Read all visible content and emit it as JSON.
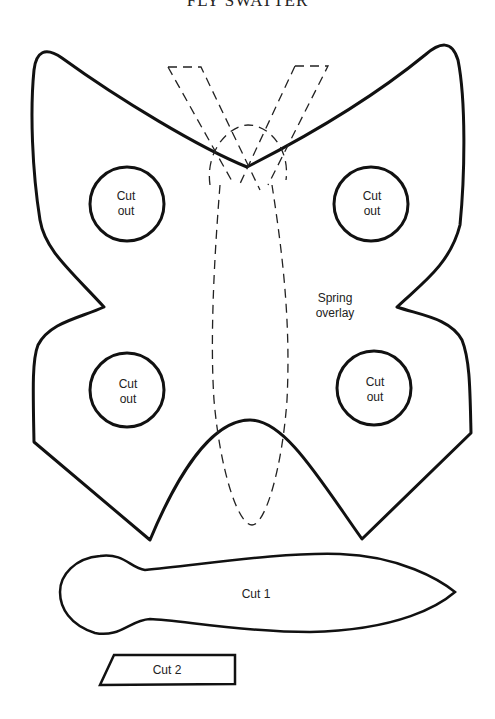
{
  "title": "FLY SWATTER",
  "swatter_body": {
    "cutouts": [
      {
        "position": "top-left",
        "line1": "Cut",
        "line2": "out"
      },
      {
        "position": "top-right",
        "line1": "Cut",
        "line2": "out"
      },
      {
        "position": "bottom-left",
        "line1": "Cut",
        "line2": "out"
      },
      {
        "position": "bottom-right",
        "line1": "Cut",
        "line2": "out"
      }
    ],
    "overlay_label": {
      "line1": "Spring",
      "line2": "overlay"
    }
  },
  "pieces": {
    "handle": {
      "label": "Cut 1"
    },
    "tab": {
      "label": "Cut 2"
    }
  }
}
